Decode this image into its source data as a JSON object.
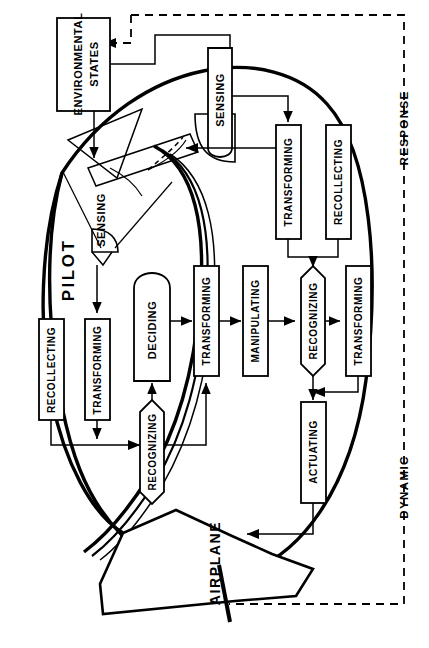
{
  "figure": {
    "orientation_note": "rotated 90 degrees counter-clockwise",
    "line_color": "#000000",
    "background_color": "#ffffff"
  },
  "regions": {
    "pilot_label": "PILOT",
    "airplane_label": "AIRPLANE",
    "response_label": "RESPONSE",
    "dynamic_label": "DYNAMIC"
  },
  "blocks": {
    "environmental_states": "ENVIRONMENTAL\nSTATES",
    "environmental_states_line1": "ENVIRONMENTAL",
    "environmental_states_line2": "STATES",
    "sensing_top": "SENSING",
    "sensing_pilot": "SENSING",
    "transforming_top_right": "TRANSFORMING",
    "recollecting_top_right": "RECOLLECTING",
    "recognizing_right": "RECOGNIZING",
    "transforming_right": "TRANSFORMING",
    "actuating": "ACTUATING",
    "recollecting_left": "RECOLLECTING",
    "transforming_left": "TRANSFORMING",
    "recognizing_left": "RECOGNIZING",
    "deciding": "DECIDING",
    "transforming_mid": "TRANSFORMING",
    "manipulating": "MANIPULATING"
  },
  "block_list": [
    {
      "id": "environmental-states",
      "label": "ENVIRONMENTAL STATES",
      "shape": "rect"
    },
    {
      "id": "sensing-top",
      "label": "SENSING",
      "shape": "rect-round-bottom"
    },
    {
      "id": "transforming-top-right",
      "label": "TRANSFORMING",
      "shape": "rect"
    },
    {
      "id": "recollecting-top-right",
      "label": "RECOLLECTING",
      "shape": "rect"
    },
    {
      "id": "recognizing-right",
      "label": "RECOGNIZING",
      "shape": "hexagon"
    },
    {
      "id": "transforming-right",
      "label": "TRANSFORMING",
      "shape": "rect"
    },
    {
      "id": "actuating",
      "label": "ACTUATING",
      "shape": "rect"
    },
    {
      "id": "recollecting-left",
      "label": "RECOLLECTING",
      "shape": "rect"
    },
    {
      "id": "transforming-left",
      "label": "TRANSFORMING",
      "shape": "rect"
    },
    {
      "id": "recognizing-left",
      "label": "RECOGNIZING",
      "shape": "hexagon"
    },
    {
      "id": "deciding",
      "label": "DECIDING",
      "shape": "stadium"
    },
    {
      "id": "transforming-mid",
      "label": "TRANSFORMING",
      "shape": "rect"
    },
    {
      "id": "manipulating",
      "label": "MANIPULATING",
      "shape": "rect"
    },
    {
      "id": "sensing-pilot",
      "label": "SENSING",
      "shape": "label-only"
    }
  ]
}
